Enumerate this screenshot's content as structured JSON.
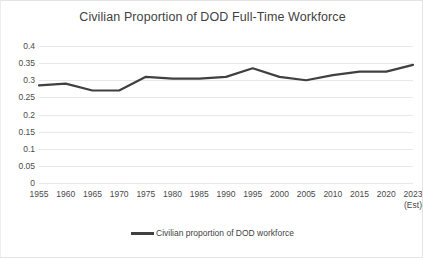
{
  "chart_data": {
    "type": "line",
    "title": "Civilian Proportion of DOD Full-Time Workforce",
    "xlabel": "",
    "ylabel": "",
    "grid": true,
    "legend_position": "bottom",
    "ylim": [
      0,
      0.4
    ],
    "yticks": [
      "0",
      "0.05",
      "0.1",
      "0.15",
      "0.2",
      "0.25",
      "0.3",
      "0.35",
      "0.4"
    ],
    "ytick_values": [
      0,
      0.05,
      0.1,
      0.15,
      0.2,
      0.25,
      0.3,
      0.35,
      0.4
    ],
    "categories": [
      "1955",
      "1960",
      "1965",
      "1970",
      "1975",
      "1980",
      "1985",
      "1990",
      "1995",
      "2000",
      "2005",
      "2010",
      "2015",
      "2020",
      "2023"
    ],
    "category_sublabels": [
      "",
      "",
      "",
      "",
      "",
      "",
      "",
      "",
      "",
      "",
      "",
      "",
      "",
      "",
      "(Est)"
    ],
    "series": [
      {
        "name": "Civilian proportion of DOD workforce",
        "color": "#404040",
        "values": [
          0.285,
          0.29,
          0.27,
          0.27,
          0.31,
          0.305,
          0.305,
          0.31,
          0.335,
          0.31,
          0.3,
          0.315,
          0.325,
          0.325,
          0.345
        ]
      }
    ]
  },
  "legend": {
    "label": "Civilian proportion of DOD workforce",
    "marker_color": "#404040"
  }
}
